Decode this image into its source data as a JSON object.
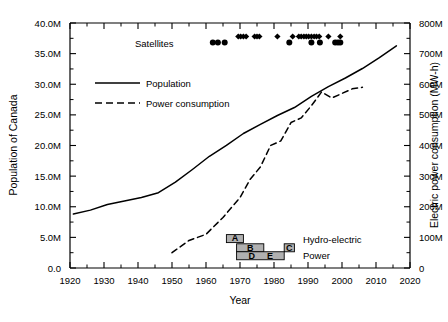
{
  "chart_data": {
    "type": "line",
    "title": "",
    "xlabel": "Year",
    "ylabel": "Population of Canada",
    "ylabel_right": "Electric power consumption (MW-h)",
    "xlim": [
      1920,
      2020
    ],
    "ylim": [
      0,
      40000000
    ],
    "ylim_right": [
      0,
      800000000
    ],
    "grid": false,
    "legend_position": "upper-left-inside",
    "xticks": [
      1920,
      1930,
      1940,
      1950,
      1960,
      1970,
      1980,
      1990,
      2000,
      2010,
      2020
    ],
    "xtick_labels": [
      "1920",
      "1930",
      "1940",
      "1950",
      "1960",
      "1970",
      "1980",
      "1990",
      "2000",
      "2010",
      "2020"
    ],
    "yticks": [
      0,
      5000000,
      10000000,
      15000000,
      20000000,
      25000000,
      30000000,
      35000000,
      40000000
    ],
    "ytick_labels": [
      "0.0",
      "5.0M",
      "10.0M",
      "15.0M",
      "20.0M",
      "25.0M",
      "30.0M",
      "35.0M",
      "40.0M"
    ],
    "yticks_right": [
      0,
      100000000,
      200000000,
      300000000,
      400000000,
      500000000,
      600000000,
      700000000,
      800000000
    ],
    "ytick_labels_right": [
      "0",
      "100M",
      "200M",
      "300M",
      "400M",
      "500M",
      "600M",
      "700M",
      "800M"
    ],
    "minor_ticks": true,
    "series": [
      {
        "name": "Population",
        "label": "Population",
        "style": "solid",
        "color": "#000000",
        "axis": "left",
        "x": [
          1921,
          1926,
          1931,
          1936,
          1941,
          1946,
          1951,
          1956,
          1961,
          1966,
          1971,
          1976,
          1981,
          1986,
          1991,
          1996,
          2001,
          2006,
          2011,
          2016
        ],
        "y": [
          8800000,
          9450000,
          10380000,
          10950000,
          11510000,
          12290000,
          14010000,
          16080000,
          18240000,
          20010000,
          21960000,
          23450000,
          24900000,
          26200000,
          28030000,
          29610000,
          31020000,
          32570000,
          34340000,
          36260000
        ]
      },
      {
        "name": "Power consumption",
        "label": "Power consumption",
        "style": "dashed",
        "color": "#000000",
        "axis": "right",
        "x": [
          1950,
          1955,
          1960,
          1965,
          1970,
          1973,
          1976,
          1979,
          1982,
          1985,
          1988,
          1991,
          1994,
          1997,
          2000,
          2003,
          2006
        ],
        "y": [
          50000000,
          90000000,
          110000000,
          165000000,
          230000000,
          290000000,
          330000000,
          400000000,
          415000000,
          475000000,
          490000000,
          530000000,
          575000000,
          555000000,
          570000000,
          585000000,
          590000000
        ]
      }
    ],
    "annotations": [
      {
        "name": "satellites",
        "label": "Satellites",
        "x": 1968,
        "y": 37000000
      },
      {
        "name": "hydro-electric-power",
        "label_line1": "Hydro-electric",
        "label_line2": "Power",
        "x": 1991,
        "y": 4200000
      }
    ],
    "satellite_markers": {
      "row_top": {
        "shape": "diamond",
        "years": [
          1969.5,
          1970.2,
          1971.0,
          1971.8,
          1974.3,
          1975.0,
          1975.7,
          1981.0,
          1985.5,
          1987.3,
          1988.0,
          1988.8,
          1989.5,
          1990.2,
          1991.0,
          1991.8,
          1992.5,
          1993.3,
          1996.0,
          1999.5
        ],
        "value": 37800000
      },
      "row_bottom": {
        "shape": "circle",
        "years": [
          1962.0,
          1963.5,
          1965.5,
          1984.5,
          1991.0,
          1993.5,
          1998.0,
          1998.8,
          1999.5
        ],
        "value": 36800000
      }
    },
    "hydro_bars": [
      {
        "letter": "A",
        "start": 1966,
        "end": 1971,
        "value": 4800000
      },
      {
        "letter": "B",
        "start": 1969,
        "end": 1977,
        "value": 3300000
      },
      {
        "letter": "C",
        "start": 1983,
        "end": 1986,
        "value": 3300000
      },
      {
        "letter": "D",
        "start": 1969,
        "end": 1983,
        "value": 2000000
      },
      {
        "letter": "E",
        "start": 1969,
        "end": 1983,
        "value": 2000000
      }
    ]
  },
  "legend": {
    "items": [
      {
        "label": "Population",
        "style": "solid"
      },
      {
        "label": "Power consumption",
        "style": "dashed"
      }
    ]
  },
  "colors": {
    "axis": "#000000",
    "line": "#000000",
    "bar_fill": "#b0b0b0",
    "bar_stroke": "#000000",
    "background": "#ffffff"
  }
}
